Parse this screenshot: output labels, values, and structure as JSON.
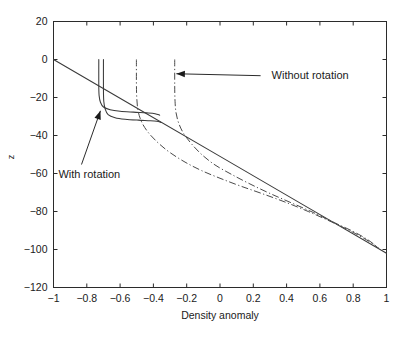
{
  "chart_data": {
    "type": "line",
    "title": "",
    "xlabel": "Density anomaly",
    "ylabel": "z",
    "xlim": [
      -1,
      1
    ],
    "ylim": [
      -120,
      20
    ],
    "xticks": [
      -1,
      -0.8,
      -0.6,
      -0.4,
      -0.2,
      0,
      0.2,
      0.4,
      0.6,
      0.8,
      1
    ],
    "xtick_labels": [
      "-1",
      "-0.8",
      "-0.6",
      "-0.4",
      "-0.2",
      "0",
      "0.2",
      "0.4",
      "0.6",
      "0.8",
      "1"
    ],
    "yticks": [
      20,
      0,
      -20,
      -40,
      -60,
      -80,
      -100,
      -120
    ],
    "ytick_labels": [
      "20",
      "0",
      "-20",
      "-40",
      "-60",
      "-80",
      "-100",
      "-120"
    ],
    "grid": false,
    "legend": "none",
    "series": [
      {
        "name": "background-linear-profile",
        "style": "solid",
        "x": [
          -1.0,
          -0.5,
          0.0,
          0.5,
          1.0
        ],
        "y": [
          0.0,
          -25.5,
          -51.0,
          -76.5,
          -102.0
        ]
      },
      {
        "name": "with-rotation-inner",
        "style": "solid",
        "x": [
          -0.728,
          -0.728,
          -0.726,
          -0.718,
          -0.7,
          -0.66,
          -0.6,
          -0.52,
          -0.44,
          -0.39,
          -0.362
        ],
        "y": [
          0.0,
          -14.0,
          -19.0,
          -22.5,
          -25.0,
          -26.4,
          -27.2,
          -27.7,
          -28.1,
          -28.5,
          -29.3
        ]
      },
      {
        "name": "with-rotation-outer",
        "style": "solid",
        "x": [
          -0.7,
          -0.7,
          -0.698,
          -0.69,
          -0.672,
          -0.63,
          -0.57,
          -0.49,
          -0.42,
          -0.38,
          -0.352
        ],
        "y": [
          0.0,
          -16.0,
          -22.0,
          -26.0,
          -29.0,
          -30.6,
          -31.4,
          -31.9,
          -32.2,
          -32.5,
          -33.1
        ]
      },
      {
        "name": "without-rotation-left",
        "style": "dash-dot",
        "x": [
          -0.502,
          -0.502,
          -0.5,
          -0.492,
          -0.47,
          -0.43,
          -0.37,
          -0.3,
          -0.21,
          -0.11,
          0.0,
          0.12,
          0.25,
          0.39,
          0.53,
          0.67,
          0.8,
          0.9,
          0.955
        ],
        "y": [
          0.0,
          -12.0,
          -20.0,
          -27.0,
          -33.0,
          -38.5,
          -44.0,
          -49.0,
          -54.0,
          -58.5,
          -62.5,
          -66.5,
          -70.5,
          -75.0,
          -80.0,
          -85.5,
          -91.0,
          -96.0,
          -99.5
        ]
      },
      {
        "name": "without-rotation-right",
        "style": "dash-dot",
        "x": [
          -0.272,
          -0.272,
          -0.27,
          -0.264,
          -0.248,
          -0.218,
          -0.17,
          -0.11,
          -0.03,
          0.07,
          0.18,
          0.3,
          0.43,
          0.56,
          0.69,
          0.8,
          0.89,
          0.955
        ],
        "y": [
          0.0,
          -14.0,
          -22.0,
          -28.0,
          -33.5,
          -39.0,
          -44.5,
          -50.0,
          -55.5,
          -60.5,
          -65.5,
          -70.5,
          -75.5,
          -80.5,
          -86.0,
          -90.5,
          -95.0,
          -99.5
        ]
      }
    ],
    "annotations": [
      {
        "label": "Without rotation",
        "text_x": 0.31,
        "text_y": -8.0,
        "point_x": -0.262,
        "point_y": -7.5
      },
      {
        "label": "With rotation",
        "text_x": -0.97,
        "text_y": -60.0,
        "point_x": -0.718,
        "point_y": -27.0
      }
    ]
  },
  "colors": {
    "background": "#ffffff",
    "axis": "#2b2b2b",
    "solid_curve": "#3a3a3a",
    "dashdot_curve": "#4a4a4a",
    "text": "#1a1a1a"
  }
}
